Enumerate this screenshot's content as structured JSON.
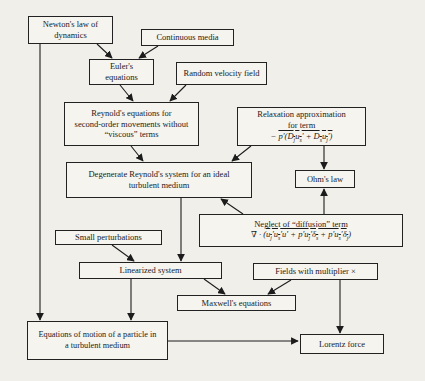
{
  "figure": {
    "colors": {
      "ink": "#1c1c1c",
      "paper": "#f1efea",
      "box_fill": "#f6f4ef"
    },
    "boxes": {
      "newton": {
        "lines": [
          "Newton's law of",
          "dynamics"
        ]
      },
      "continuous": {
        "lines": [
          "Continuous media"
        ]
      },
      "euler": {
        "lines": [
          "Euler's",
          "equations"
        ]
      },
      "random": {
        "lines": [
          "Random velocity field"
        ]
      },
      "reynolds": {
        "lines": [
          "Reynold's equations for",
          "second-order movements without",
          "“viscous” terms"
        ]
      },
      "relaxation": {
        "lines": [
          "Relaxation approximation",
          "for term"
        ],
        "formula": {
          "minus": "− ",
          "a1": "p′(D",
          "b1": "j",
          "a2": "u",
          "b2": "s",
          "a3": "′ + D",
          "b3": "s",
          "a4": "u",
          "b4": "j",
          "a5": "′)"
        }
      },
      "degenerate": {
        "lines": [
          "Degenerate Reynold's system for an ideal",
          "turbulent medium"
        ]
      },
      "ohm": {
        "lines": [
          "Ohm's law"
        ]
      },
      "neglect": {
        "title": "Neglect of “diffusion” term",
        "formula": {
          "prefix": "∇ · (",
          "a1": "u",
          "b1": "j",
          "a2": "′u",
          "b2": "s",
          "a3": "′u′ + p′u",
          "b3": "j",
          "a4": "′δ",
          "b4": "s",
          "a5": " + p′u",
          "b5": "s",
          "a6": "′δ",
          "b6": "j",
          "suffix": ")"
        }
      },
      "small": {
        "lines": [
          "Small perturbations"
        ]
      },
      "linearized": {
        "lines": [
          "Linearized system"
        ]
      },
      "fields": {
        "lines": [
          "Fields with multiplier ×"
        ]
      },
      "maxwell": {
        "lines": [
          "Maxwell's equations"
        ]
      },
      "eqmotion": {
        "lines": [
          "Equations of motion of a particle in",
          "a turbulent medium"
        ]
      },
      "lorentz": {
        "lines": [
          "Lorentz force"
        ]
      }
    }
  }
}
